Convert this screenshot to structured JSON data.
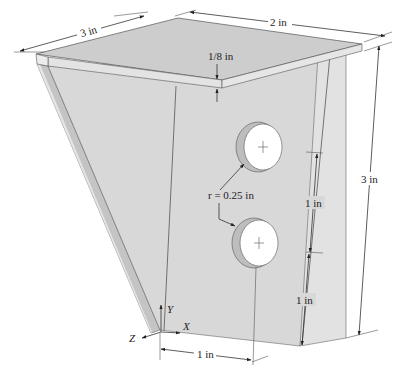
{
  "figure": {
    "type": "isometric bracket drawing",
    "colors": {
      "face_main": "#d6d6d6",
      "face_top": "#cfcfcf",
      "face_edge": "#e6e6e6",
      "face_side_dark": "#bdbdbd",
      "hole_fill": "#ffffff",
      "hole_wall": "#bcbcbc",
      "line": "#333333"
    }
  },
  "dimensions": {
    "top_depth": "3 in",
    "top_width": "2 in",
    "plate_thickness": "1/8 in",
    "height": "3 in",
    "hole_spacing": "1 in",
    "hole_to_bottom": "1 in",
    "hole_offset_x": "1 in",
    "hole_radius": "r = 0.25 in"
  },
  "axes": {
    "x": "X",
    "y": "Y",
    "z": "Z"
  }
}
